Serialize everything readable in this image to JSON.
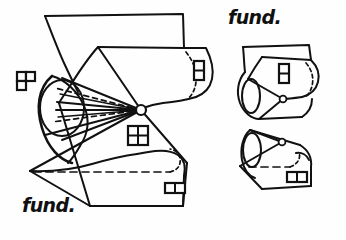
{
  "figure": {
    "background_color": "#fefefe",
    "ink_color": "#111111",
    "width": 346,
    "height": 240,
    "labels": [
      {
        "name": "fund-label-top-right",
        "text": "fund.",
        "x": 228,
        "y": 8
      },
      {
        "name": "fund-label-bottom-left",
        "text": "fund.",
        "x": 22,
        "y": 196
      }
    ],
    "markers": [
      {
        "name": "marker-p-shape",
        "kind": "grid-p",
        "cells": 3,
        "x": 16,
        "y": 71
      },
      {
        "name": "marker-four-cell-window",
        "kind": "grid-2x2",
        "cells": 4,
        "x": 127,
        "y": 125
      },
      {
        "name": "marker-vertical-pair",
        "kind": "grid-1x2",
        "cells": 2,
        "x": 193,
        "y": 60
      },
      {
        "name": "marker-horizontal-pair",
        "kind": "grid-2x1",
        "cells": 2,
        "x": 164,
        "y": 182
      },
      {
        "name": "marker-vertical-pair-2",
        "kind": "grid-1x2",
        "cells": 2,
        "x": 278,
        "y": 63
      },
      {
        "name": "marker-horizontal-pair-2",
        "kind": "grid-2x1",
        "cells": 2,
        "x": 297,
        "y": 172
      }
    ],
    "nodes": [
      {
        "name": "cone-apex-node-main",
        "x": 141,
        "y": 110,
        "r": 5.0
      },
      {
        "name": "cone-apex-node-upper",
        "x": 283,
        "y": 99,
        "r": 3.4
      },
      {
        "name": "cone-apex-node-lower",
        "x": 282,
        "y": 142,
        "r": 3.4
      }
    ],
    "panels": [
      {
        "name": "main-fundamental-domain",
        "position": "left"
      },
      {
        "name": "quotient-cone-upper",
        "position": "top-right"
      },
      {
        "name": "quotient-cone-lower",
        "position": "bottom-right"
      }
    ]
  }
}
